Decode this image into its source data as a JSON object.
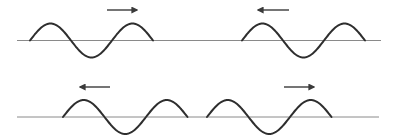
{
  "diagram": {
    "title": "",
    "colors": {
      "background": "#ffffff",
      "baseline": "#8a8a8a",
      "wave": "#2e2e2e",
      "arrow": "#3a3a3a"
    },
    "rows": [
      {
        "baseline": {
          "x1": 17,
          "x2": 381,
          "y": 40.5
        },
        "pulses": [
          {
            "id": "top-left",
            "start_x": 30,
            "wavelength": 82,
            "cycles": 1.5,
            "amplitude": 17,
            "direction": "right",
            "arrow": {
              "x1": 107,
              "x2": 137,
              "y": 10
            }
          },
          {
            "id": "top-right",
            "start_x": 242,
            "wavelength": 82,
            "cycles": 1.5,
            "amplitude": 17,
            "direction": "left",
            "arrow": {
              "x1": 258,
              "x2": 289,
              "y": 10
            }
          }
        ]
      },
      {
        "baseline": {
          "x1": 17,
          "x2": 379,
          "y": 117
        },
        "pulses": [
          {
            "id": "bottom-left",
            "start_x": 63,
            "wavelength": 83,
            "cycles": 1.5,
            "amplitude": 17,
            "direction": "left",
            "arrow": {
              "x1": 80,
              "x2": 110,
              "y": 87
            }
          },
          {
            "id": "bottom-right",
            "start_x": 207,
            "wavelength": 83,
            "cycles": 1.5,
            "amplitude": 17,
            "direction": "right",
            "arrow": {
              "x1": 284,
              "x2": 314,
              "y": 87
            }
          }
        ]
      }
    ]
  }
}
